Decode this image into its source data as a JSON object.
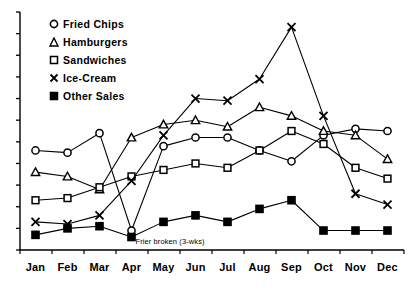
{
  "legend": {
    "position": "top-left-inside",
    "items": [
      {
        "label": "Fried Chips",
        "marker": "circle-open-icon"
      },
      {
        "label": "Hamburgers",
        "marker": "triangle-open-icon"
      },
      {
        "label": "Sandwiches",
        "marker": "square-open-icon"
      },
      {
        "label": "Ice-Cream",
        "marker": "cross-icon"
      },
      {
        "label": "Other Sales",
        "marker": "square-filled-icon"
      }
    ]
  },
  "annotations": [
    {
      "text": "Frier broken (3-wks)",
      "anchor_category": "Apr",
      "anchor_series": "Fried Chips"
    }
  ],
  "chart_data": {
    "type": "line",
    "title": "",
    "subtitle": "",
    "xlabel": "",
    "ylabel": "",
    "grid": false,
    "legend_position": "top-left-inside",
    "categories": [
      "Jan",
      "Feb",
      "Mar",
      "Apr",
      "May",
      "Jun",
      "Jul",
      "Aug",
      "Sep",
      "Oct",
      "Nov",
      "Dec"
    ],
    "ylim": [
      0,
      110
    ],
    "yticks": [
      0,
      10,
      20,
      30,
      40,
      50,
      60,
      70,
      80,
      90,
      100,
      110
    ],
    "ytick_labels": [],
    "series": [
      {
        "name": "Fried Chips",
        "marker": "circle-open-icon",
        "values": [
          46,
          45,
          54,
          9,
          48,
          52,
          52,
          46,
          41,
          53,
          56,
          55
        ]
      },
      {
        "name": "Hamburgers",
        "marker": "triangle-open-icon",
        "values": [
          36,
          34,
          28,
          52,
          58,
          60,
          57,
          66,
          62,
          55,
          53,
          42
        ]
      },
      {
        "name": "Sandwiches",
        "marker": "square-open-icon",
        "values": [
          23,
          24,
          29,
          34,
          37,
          40,
          38,
          46,
          55,
          49,
          38,
          33
        ]
      },
      {
        "name": "Ice-Cream",
        "marker": "cross-icon",
        "values": [
          13,
          12,
          16,
          32,
          53,
          70,
          69,
          79,
          103,
          62,
          26,
          21
        ]
      },
      {
        "name": "Other Sales",
        "marker": "square-filled-icon",
        "values": [
          7,
          10,
          11,
          6,
          13,
          16,
          13,
          19,
          23,
          9,
          9,
          9
        ]
      }
    ],
    "annotation_text": "Frier broken (3-wks)"
  }
}
